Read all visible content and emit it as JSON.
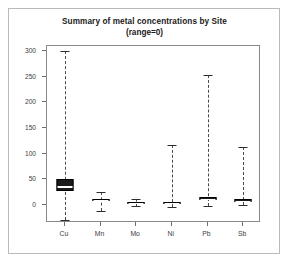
{
  "chart_data": {
    "type": "box",
    "title": "Summary of metal concentrations by Site",
    "subtitle": "(range=0)",
    "xlabel": "",
    "ylabel": "",
    "categories": [
      "Cu",
      "Mn",
      "Mo",
      "Ni",
      "Pb",
      "Sb"
    ],
    "ylim": [
      -35,
      310
    ],
    "yticks": [
      0,
      50,
      100,
      150,
      200,
      250,
      300
    ],
    "ytick_labels": [
      "0",
      "50",
      "100",
      "150",
      "200",
      "250",
      "300"
    ],
    "grid": false,
    "legend": null,
    "box_color": "#1a1a1a",
    "whisker_style": "dashed",
    "boxes": [
      {
        "category": "Cu",
        "whisker_low": -30,
        "q1": 28,
        "median": 38,
        "q3": 50,
        "whisker_high": 300
      },
      {
        "category": "Mn",
        "whisker_low": -11,
        "q1": 7,
        "median": 9,
        "q3": 12,
        "whisker_high": 25
      },
      {
        "category": "Mo",
        "whisker_low": -2,
        "q1": 3,
        "median": 4,
        "q3": 6,
        "whisker_high": 12
      },
      {
        "category": "Ni",
        "whisker_low": -3,
        "q1": 2,
        "median": 4,
        "q3": 6,
        "whisker_high": 118
      },
      {
        "category": "Pb",
        "whisker_low": -2,
        "q1": 9,
        "median": 12,
        "q3": 15,
        "whisker_high": 253
      },
      {
        "category": "Sb",
        "whisker_low": 0,
        "q1": 6,
        "median": 8,
        "q3": 11,
        "whisker_high": 113
      }
    ]
  }
}
